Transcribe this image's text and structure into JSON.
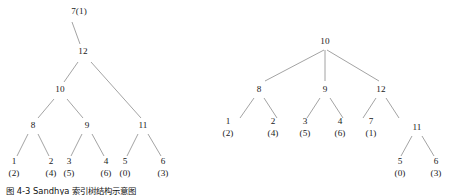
{
  "figure": {
    "background_color": "#ffffff",
    "edge_color": "#8b8b8b",
    "text_color": "#1a1a1a",
    "caption": "图 4-3  Sandhya 索引树结构示意图"
  },
  "trees": [
    {
      "id": "left-tree",
      "name": "left-tree",
      "root": "7(1)",
      "nodes": [
        {
          "id": "l-root",
          "key": "7",
          "sub": "(1)",
          "inline": true,
          "x": 79,
          "y": 12
        },
        {
          "id": "l-12",
          "key": "12",
          "sub": "",
          "inline": false,
          "x": 83,
          "y": 52
        },
        {
          "id": "l-10",
          "key": "10",
          "sub": "",
          "inline": false,
          "x": 60,
          "y": 90
        },
        {
          "id": "l-8",
          "key": "8",
          "sub": "",
          "inline": false,
          "x": 33,
          "y": 126
        },
        {
          "id": "l-9",
          "key": "9",
          "sub": "",
          "inline": false,
          "x": 87,
          "y": 126
        },
        {
          "id": "l-11",
          "key": "11",
          "sub": "",
          "inline": false,
          "x": 143,
          "y": 126
        },
        {
          "id": "l-1",
          "key": "1",
          "sub": "(2)",
          "inline": false,
          "x": 14,
          "y": 168
        },
        {
          "id": "l-2",
          "key": "2",
          "sub": "(4)",
          "inline": false,
          "x": 51,
          "y": 168
        },
        {
          "id": "l-3",
          "key": "3",
          "sub": "(5)",
          "inline": false,
          "x": 69,
          "y": 168
        },
        {
          "id": "l-4",
          "key": "4",
          "sub": "(6)",
          "inline": false,
          "x": 106,
          "y": 168
        },
        {
          "id": "l-5",
          "key": "5",
          "sub": "(0)",
          "inline": false,
          "x": 125,
          "y": 168
        },
        {
          "id": "l-6",
          "key": "6",
          "sub": "(3)",
          "inline": false,
          "x": 163,
          "y": 168
        }
      ],
      "edges": [
        {
          "from": "l-root",
          "to": "l-12",
          "x1": 72,
          "y1": 22,
          "x2": 80,
          "y2": 44
        },
        {
          "from": "l-12",
          "to": "l-10",
          "x1": 78,
          "y1": 62,
          "x2": 64,
          "y2": 82
        },
        {
          "from": "l-12",
          "to": "l-11",
          "x1": 91,
          "y1": 62,
          "x2": 141,
          "y2": 118
        },
        {
          "from": "l-10",
          "to": "l-8",
          "x1": 54,
          "y1": 99,
          "x2": 38,
          "y2": 118
        },
        {
          "from": "l-10",
          "to": "l-9",
          "x1": 67,
          "y1": 99,
          "x2": 83,
          "y2": 118
        },
        {
          "from": "l-8",
          "to": "l-1",
          "x1": 28,
          "y1": 134,
          "x2": 17,
          "y2": 156
        },
        {
          "from": "l-8",
          "to": "l-2",
          "x1": 38,
          "y1": 134,
          "x2": 49,
          "y2": 156
        },
        {
          "from": "l-9",
          "to": "l-3",
          "x1": 82,
          "y1": 134,
          "x2": 71,
          "y2": 156
        },
        {
          "from": "l-9",
          "to": "l-4",
          "x1": 92,
          "y1": 134,
          "x2": 104,
          "y2": 156
        },
        {
          "from": "l-11",
          "to": "l-5",
          "x1": 138,
          "y1": 134,
          "x2": 127,
          "y2": 156
        },
        {
          "from": "l-11",
          "to": "l-6",
          "x1": 148,
          "y1": 134,
          "x2": 161,
          "y2": 156
        }
      ]
    },
    {
      "id": "right-tree",
      "name": "right-tree",
      "root": "10",
      "nodes": [
        {
          "id": "r-10",
          "key": "10",
          "sub": "",
          "inline": false,
          "x": 325,
          "y": 42
        },
        {
          "id": "r-8",
          "key": "8",
          "sub": "",
          "inline": false,
          "x": 259,
          "y": 90
        },
        {
          "id": "r-9",
          "key": "9",
          "sub": "",
          "inline": false,
          "x": 325,
          "y": 90
        },
        {
          "id": "r-12",
          "key": "12",
          "sub": "",
          "inline": false,
          "x": 381,
          "y": 90
        },
        {
          "id": "r-1",
          "key": "1",
          "sub": "(2)",
          "inline": false,
          "x": 228,
          "y": 128
        },
        {
          "id": "r-2",
          "key": "2",
          "sub": "(4)",
          "inline": false,
          "x": 273,
          "y": 128
        },
        {
          "id": "r-3",
          "key": "3",
          "sub": "(5)",
          "inline": false,
          "x": 305,
          "y": 128
        },
        {
          "id": "r-4",
          "key": "4",
          "sub": "(6)",
          "inline": false,
          "x": 340,
          "y": 128
        },
        {
          "id": "r-7",
          "key": "7",
          "sub": "(1)",
          "inline": false,
          "x": 371,
          "y": 128
        },
        {
          "id": "r-11",
          "key": "11",
          "sub": "",
          "inline": false,
          "x": 417,
          "y": 128
        },
        {
          "id": "r-5",
          "key": "5",
          "sub": "(0)",
          "inline": false,
          "x": 400,
          "y": 168
        },
        {
          "id": "r-6",
          "key": "6",
          "sub": "(3)",
          "inline": false,
          "x": 436,
          "y": 168
        }
      ],
      "edges": [
        {
          "from": "r-10",
          "to": "r-8",
          "x1": 324,
          "y1": 50,
          "x2": 265,
          "y2": 81
        },
        {
          "from": "r-10",
          "to": "r-9",
          "x1": 325,
          "y1": 50,
          "x2": 325,
          "y2": 81
        },
        {
          "from": "r-10",
          "to": "r-12",
          "x1": 327,
          "y1": 50,
          "x2": 379,
          "y2": 81
        },
        {
          "from": "r-8",
          "to": "r-1",
          "x1": 254,
          "y1": 98,
          "x2": 240,
          "y2": 118
        },
        {
          "from": "r-8",
          "to": "r-2",
          "x1": 264,
          "y1": 98,
          "x2": 277,
          "y2": 118
        },
        {
          "from": "r-9",
          "to": "r-3",
          "x1": 320,
          "y1": 98,
          "x2": 307,
          "y2": 118
        },
        {
          "from": "r-9",
          "to": "r-4",
          "x1": 330,
          "y1": 98,
          "x2": 343,
          "y2": 118
        },
        {
          "from": "r-12",
          "to": "r-7",
          "x1": 376,
          "y1": 98,
          "x2": 363,
          "y2": 118
        },
        {
          "from": "r-12",
          "to": "r-11",
          "x1": 386,
          "y1": 98,
          "x2": 399,
          "y2": 118
        },
        {
          "from": "r-11",
          "to": "r-5",
          "x1": 412,
          "y1": 136,
          "x2": 401,
          "y2": 156
        },
        {
          "from": "r-11",
          "to": "r-6",
          "x1": 422,
          "y1": 136,
          "x2": 434,
          "y2": 156
        }
      ]
    }
  ]
}
